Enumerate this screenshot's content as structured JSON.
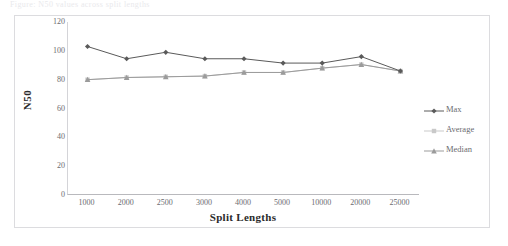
{
  "figure": {
    "ghost_caption": "Figure: N50 values across split lengths"
  },
  "chart_data": {
    "type": "line",
    "title": "",
    "xlabel": "Split Lengths",
    "ylabel": "N50",
    "categories": [
      "1000",
      "2000",
      "2500",
      "3000",
      "4000",
      "5000",
      "10000",
      "20000",
      "25000"
    ],
    "series": [
      {
        "name": "Max",
        "color": "#5a5a5a",
        "marker": "diamond",
        "values": [
          103,
          94.5,
          99,
          94.5,
          94.5,
          91.5,
          91.5,
          96,
          86
        ]
      },
      {
        "name": "Average",
        "color": "#c9c9c9",
        "marker": "square",
        "values": [
          80,
          81.5,
          82,
          82.5,
          85,
          85,
          88,
          90.5,
          86
        ]
      },
      {
        "name": "Median",
        "color": "#9b9b9b",
        "marker": "triangle",
        "values": [
          80,
          81.5,
          82,
          82.5,
          85,
          85,
          88,
          90.5,
          86
        ]
      }
    ],
    "ylim": [
      0,
      120
    ],
    "yticks": [
      120,
      100,
      80,
      60,
      40,
      20,
      0
    ],
    "grid": false,
    "legend_position": "right"
  },
  "legend": {
    "entries": [
      {
        "label": "Max"
      },
      {
        "label": "Average"
      },
      {
        "label": "Median"
      }
    ]
  }
}
